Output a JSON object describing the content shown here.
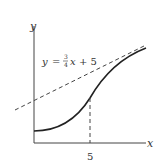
{
  "diagram": {
    "axes": {
      "x_label": "x",
      "y_label": "y"
    },
    "tangent_line": {
      "label_y": "y",
      "label_eq": "=",
      "label_num": "3",
      "label_den": "4",
      "label_x": "x",
      "label_plus": "+ 5",
      "equation": "y = 3/4 x + 5",
      "style": "dashed"
    },
    "curve": {
      "style": "solid",
      "description": "increasing S-shaped curve tangent to dashed line at x = 5"
    },
    "marker": {
      "x_tick_label": "5",
      "style": "dashed vertical"
    },
    "colors": {
      "stroke": "#222222",
      "text": "#333333",
      "background": "#ffffff"
    }
  }
}
